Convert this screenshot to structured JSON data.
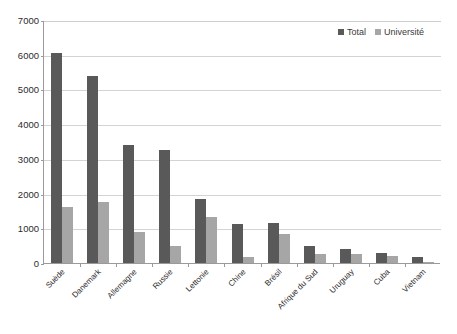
{
  "chart_data": {
    "type": "bar",
    "title": "",
    "subtitle": "",
    "xlabel": "",
    "ylabel": "",
    "ylim": [
      0,
      7000
    ],
    "ytick_step": 1000,
    "yticks": [
      0,
      1000,
      2000,
      3000,
      4000,
      5000,
      6000,
      7000
    ],
    "ytick_labels": [
      "0",
      "1000",
      "2000",
      "3000",
      "4000",
      "5000",
      "6000",
      "7000"
    ],
    "grid": "horizontal",
    "legend_position": "top-right",
    "categories": [
      "Suède",
      "Danemark",
      "Allemagne",
      "Russie",
      "Lettonie",
      "Chine",
      "Brésil",
      "Afrique du Sud",
      "Uruguay",
      "Cuba",
      "Vietnam"
    ],
    "series": [
      {
        "name": "Total",
        "color": "#595959",
        "values": [
          6050,
          5400,
          3400,
          3250,
          1850,
          1130,
          1150,
          480,
          400,
          300,
          175
        ]
      },
      {
        "name": "Université",
        "color": "#a6a6a6",
        "values": [
          1600,
          1750,
          900,
          500,
          1330,
          180,
          850,
          260,
          260,
          210,
          40
        ]
      }
    ]
  },
  "legend": {
    "items": [
      {
        "label": "Total",
        "swatch": "total"
      },
      {
        "label": "Université",
        "swatch": "univ"
      }
    ]
  },
  "colors": {
    "total": "#595959",
    "universite": "#a6a6a6",
    "gridline": "#d4d4d4",
    "axis": "#9a9a9a",
    "text": "#2b2b2b",
    "background": "#ffffff"
  }
}
